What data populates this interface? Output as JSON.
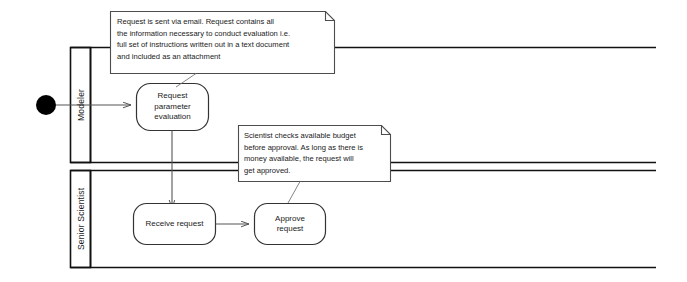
{
  "diagram": {
    "type": "uml-activity-swimlane",
    "colors": {
      "stroke": "#333333",
      "lane_border": "#111111",
      "note_border": "#4d4d4d",
      "note_fill": "#ffffff",
      "start_node_fill": "#000000",
      "text": "#1a1a1a",
      "background": "#ffffff"
    },
    "lanes": [
      {
        "id": "modeler",
        "label": "Modeler"
      },
      {
        "id": "senior-scientist",
        "label": "Senior Scientist"
      }
    ],
    "start_node": {
      "name": "start-node"
    },
    "activities": [
      {
        "id": "request-parameter-evaluation",
        "lane": "modeler",
        "label": "Request\nparameter\nevaluation"
      },
      {
        "id": "receive-request",
        "lane": "senior-scientist",
        "label": "Receive request"
      },
      {
        "id": "approve-request",
        "lane": "senior-scientist",
        "label": "Approve\nrequest"
      }
    ],
    "transitions": [
      {
        "from": "start-node",
        "to": "request-parameter-evaluation"
      },
      {
        "from": "request-parameter-evaluation",
        "to": "receive-request"
      },
      {
        "from": "receive-request",
        "to": "approve-request"
      }
    ],
    "notes": [
      {
        "id": "note-request-email",
        "attached_to": "request-parameter-evaluation",
        "text": "Request is sent via email. Request contains all\nthe information necessary to conduct evaluation i.e.\nfull set of instructions written out in a text document\nand included as an attachment"
      },
      {
        "id": "note-budget-check",
        "attached_to": "approve-request",
        "text": "Scientist checks available budget\nbefore approval. As long as there is\nmoney available, the request will\nget approved."
      }
    ]
  }
}
